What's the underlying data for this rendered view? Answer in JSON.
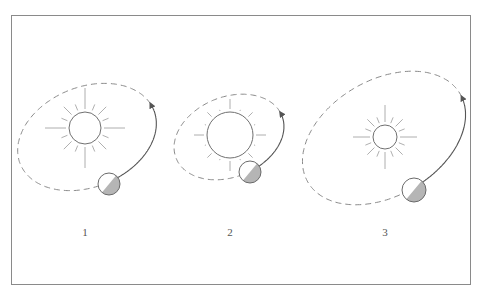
{
  "diagram": {
    "colors": {
      "frame": "#8a8a8a",
      "orbit_dashed": "#8a8a8a",
      "orbit_solid": "#555555",
      "star_stroke": "#707070",
      "ray_stroke": "#9a9a9a",
      "planet_stroke": "#6a6a6a",
      "planet_shadow": "#b5b5b5"
    },
    "panels": [
      {
        "label": "1",
        "label_pos": [
          85,
          232
        ],
        "star": {
          "cx": 85,
          "cy": 128,
          "r": 16,
          "ray_inner": 19,
          "ray_long": 40,
          "ray_short": 30
        },
        "orbit": {
          "cx": 87,
          "cy": 137,
          "rx": 72,
          "ry": 50,
          "rotate": -22
        },
        "planet": {
          "cx": 109,
          "cy": 184,
          "r": 11
        },
        "arrow_tip": [
          153,
          102
        ]
      },
      {
        "label": "2",
        "label_pos": [
          230,
          232
        ],
        "star": {
          "cx": 230,
          "cy": 135,
          "r": 23,
          "ray_inner": 26,
          "ray_long": 36,
          "ray_short": 32
        },
        "orbit": {
          "cx": 229,
          "cy": 137,
          "rx": 57,
          "ry": 40,
          "rotate": -22
        },
        "planet": {
          "cx": 250,
          "cy": 172,
          "r": 11
        },
        "arrow_tip": [
          281,
          112
        ]
      },
      {
        "label": "3",
        "label_pos": [
          385,
          232
        ],
        "star": {
          "cx": 385,
          "cy": 137,
          "r": 12,
          "ray_inner": 15,
          "ray_long": 32,
          "ray_short": 25
        },
        "orbit": {
          "cx": 384,
          "cy": 138,
          "rx": 88,
          "ry": 58,
          "rotate": -30
        },
        "planet": {
          "cx": 414,
          "cy": 190,
          "r": 12
        },
        "arrow_tip": [
          463,
          96
        ]
      }
    ]
  }
}
